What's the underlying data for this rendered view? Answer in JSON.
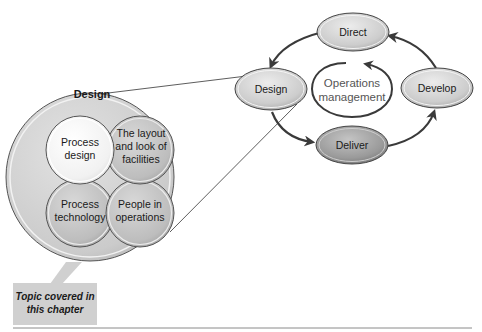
{
  "cycle": {
    "center_label_line1": "Operations",
    "center_label_line2": "management",
    "nodes": {
      "direct": "Direct",
      "design": "Design",
      "develop": "Develop",
      "deliver": "Deliver"
    }
  },
  "design_detail": {
    "title": "Design",
    "topics": {
      "process_design_l1": "Process",
      "process_design_l2": "design",
      "layout_l1": "The layout",
      "layout_l2": "and look of",
      "layout_l3": "facilities",
      "process_tech_l1": "Process",
      "process_tech_l2": "technology",
      "people_l1": "People in",
      "people_l2": "operations"
    }
  },
  "callout": {
    "line1": "Topic covered in",
    "line2": "this chapter"
  },
  "colors": {
    "node_fill": "#d2d2d2",
    "deliver_fill": "#9e9e9e",
    "big_circle_fill": "#cfcfcf",
    "highlight_fill": "#f2f2f2",
    "arrow": "#3a3a3a",
    "callout_fill": "#d0d0d0"
  }
}
